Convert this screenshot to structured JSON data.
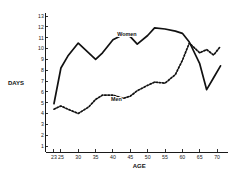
{
  "chart_data": {
    "type": "line",
    "title": "",
    "xlabel": "AGE",
    "ylabel": "DAYS",
    "xlim": [
      22,
      72
    ],
    "ylim": [
      0,
      13
    ],
    "grid": false,
    "legend_position": "inline-on-curves",
    "xticks": [
      23,
      25,
      30,
      35,
      40,
      45,
      50,
      55,
      60,
      65,
      70
    ],
    "xtick_labels": [
      "23",
      "25",
      "30",
      "35",
      "40",
      "45",
      "50",
      "55",
      "60",
      "65",
      "70"
    ],
    "yticks": [
      1,
      2,
      3,
      4,
      5,
      6,
      7,
      8,
      9,
      10,
      11,
      12,
      13
    ],
    "ytick_labels": [
      "1",
      "2",
      "3",
      "4",
      "5",
      "6",
      "7",
      "8",
      "9",
      "10",
      "11",
      "12",
      "13"
    ],
    "series": [
      {
        "name": "Women",
        "style": "solid",
        "label_x": 44,
        "label_y": 11.15,
        "x": [
          23,
          25,
          27,
          30,
          33,
          35,
          37,
          40,
          43,
          45,
          47,
          50,
          52,
          55,
          58,
          60,
          62,
          65,
          67,
          69,
          71
        ],
        "values": [
          4.9,
          8.2,
          9.3,
          10.5,
          9.6,
          9.0,
          9.6,
          10.8,
          11.3,
          11.1,
          10.4,
          11.2,
          11.9,
          11.8,
          11.6,
          11.4,
          10.6,
          8.6,
          6.2,
          7.3,
          8.4
        ]
      },
      {
        "name": "Men",
        "style": "dashed",
        "label_x": 41,
        "label_y": 5.15,
        "x": [
          23,
          25,
          27,
          30,
          33,
          35,
          37,
          40,
          43,
          45,
          47,
          50,
          52,
          55,
          58,
          60,
          62,
          65,
          67,
          69,
          71
        ],
        "values": [
          4.4,
          4.7,
          4.4,
          4.0,
          4.6,
          5.3,
          5.7,
          5.7,
          5.4,
          5.6,
          6.1,
          6.6,
          6.9,
          6.8,
          7.6,
          8.9,
          10.5,
          9.6,
          9.9,
          9.4,
          10.2
        ]
      }
    ]
  }
}
